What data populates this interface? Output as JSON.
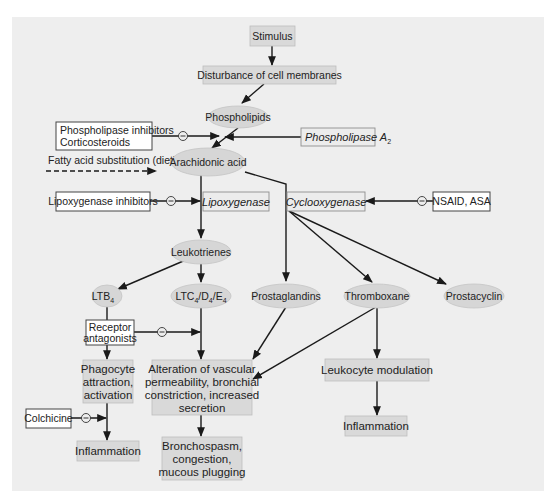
{
  "diagram": {
    "colors": {
      "panel_bg": "#eeeeee",
      "shaded_box": "#d9d9d9",
      "ellipse_fill": "#d6d6d6",
      "white_box": "#ffffff",
      "line": "#1a1a1a"
    },
    "nodes": {
      "stimulus": "Stimulus",
      "disturbance": "Disturbance of cell membranes",
      "phospholipids": "Phospholipids",
      "phospholipase_inhibitors": [
        "Phospholipase inhibitors",
        "Corticosteroids"
      ],
      "phospholipase_a2": {
        "text": "Phospholipase A",
        "subscript": "2"
      },
      "fatty_acid": "Fatty acid substitution (diet)",
      "arachidonic_acid": "Arachidonic acid",
      "lipoxygenase_inhibitors": "Lipoxygenase inhibitors",
      "lipoxygenase": "Lipoxygenase",
      "cyclooxygenase": "Cyclooxygenase",
      "nsaid": "NSAID, ASA",
      "leukotrienes": "Leukotrienes",
      "ltb4": {
        "text": "LTB",
        "subscript": "4"
      },
      "ltc4": {
        "parts": [
          "LTC",
          "4",
          "/D",
          "4",
          "/E",
          "4"
        ]
      },
      "prostaglandins": "Prostaglandins",
      "thromboxane": "Thromboxane",
      "prostacyclin": "Prostacyclin",
      "receptor_antagonists": [
        "Receptor",
        "antagonists"
      ],
      "phagocyte": [
        "Phagocyte",
        "attraction,",
        "activation"
      ],
      "alteration": [
        "Alteration of vascular",
        "permeability, bronchial",
        "constriction, increased",
        "secretion"
      ],
      "leukocyte_modulation": "Leukocyte modulation",
      "colchicine": "Colchicine",
      "inflammation_left": "Inflammation",
      "bronchospasm": [
        "Bronchospasm,",
        "congestion,",
        "mucous plugging"
      ],
      "inflammation_right": "Inflammation"
    },
    "inhibitor_symbol": "−"
  }
}
